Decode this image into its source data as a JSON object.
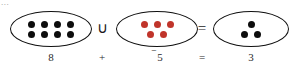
{
  "figure": {
    "corner_mark": "...",
    "operation_description": "8 + negative 5 = 3",
    "background_color": "#ffffff"
  },
  "colors": {
    "positive_counter": "#0d0d0d",
    "negative_counter": "#c0342a",
    "outline": "#101010",
    "text": "#2b2b2b"
  },
  "groups": [
    {
      "id": "group-1",
      "counter_color": "positive",
      "count": 8,
      "rows": [
        4,
        4
      ],
      "label": "8"
    },
    {
      "id": "group-2",
      "counter_color": "negative",
      "count": 5,
      "rows": [
        3,
        2
      ],
      "label_sign": "⁻",
      "label_value": "5"
    },
    {
      "id": "group-3",
      "counter_color": "positive",
      "count": 3,
      "rows": [
        1,
        2
      ],
      "label": "3"
    }
  ],
  "operators": {
    "set_union": "∪",
    "set_equals": "=",
    "arith_plus": "+",
    "arith_equals": "="
  }
}
